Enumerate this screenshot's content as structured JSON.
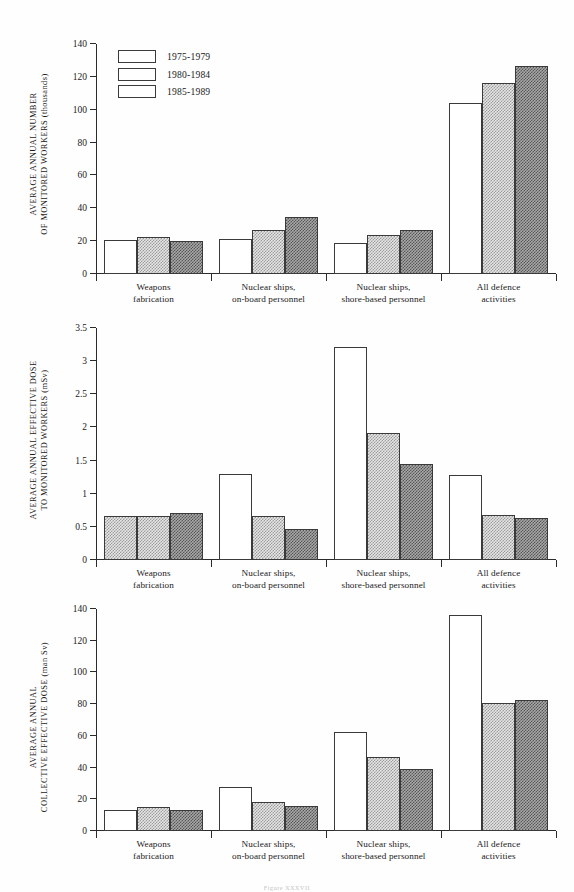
{
  "figure": {
    "caption": "Figure XXXVII",
    "legend": [
      {
        "label": "1975-1979",
        "swatch": "white"
      },
      {
        "label": "1980-1984",
        "swatch": "light-hatch"
      },
      {
        "label": "1985-1989",
        "swatch": "dark-hatch"
      }
    ],
    "categories": [
      "Weapons\nfabrication",
      "Nuclear ships,\non-board personnel",
      "Nuclear ships,\nshore-based personnel",
      "All defence\nactivities"
    ]
  },
  "chart_data": [
    {
      "type": "bar",
      "title": "",
      "ylabel": "AVERAGE ANNUAL NUMBER\nOF MONITORED WORKERS (thousands)",
      "xlabel": "",
      "ylim": [
        0,
        140
      ],
      "yticks": [
        0,
        20,
        40,
        60,
        80,
        100,
        120,
        140
      ],
      "ytick_labels": [
        "0",
        "20",
        "40",
        "60",
        "80",
        "100",
        "120",
        "140"
      ],
      "grid": false,
      "legend_position": "top-left",
      "categories": [
        "Weapons\nfabrication",
        "Nuclear ships,\non-board personnel",
        "Nuclear ships,\nshore-based personnel",
        "All defence\nactivities"
      ],
      "series": [
        {
          "name": "1975-1979",
          "values": [
            21,
            21.5,
            19,
            104
          ]
        },
        {
          "name": "1980-1984",
          "values": [
            22.5,
            26.5,
            24,
            116
          ]
        },
        {
          "name": "1985-1989",
          "values": [
            20,
            34.5,
            27,
            126.5
          ]
        }
      ]
    },
    {
      "type": "bar",
      "title": "",
      "ylabel": "AVERAGE ANNUAL EFFECTIVE DOSE\nTO MONITORED WORKERS (mSv)",
      "xlabel": "",
      "ylim": [
        0,
        3.5
      ],
      "yticks": [
        0,
        0.5,
        1,
        1.5,
        2,
        2.5,
        3,
        3.5
      ],
      "ytick_labels": [
        "0",
        "0.5",
        "1",
        "1.5",
        "2",
        "2.5",
        "3",
        "3.5"
      ],
      "grid": false,
      "legend_position": "none",
      "categories": [
        "Weapons\nfabrication",
        "Nuclear ships,\non-board personnel",
        "Nuclear ships,\nshore-based personnel",
        "All defence\nactivities"
      ],
      "series": [
        {
          "name": "1975-1979",
          "values": [
            0.67,
            1.3,
            3.22,
            1.28
          ]
        },
        {
          "name": "1980-1984",
          "values": [
            0.67,
            0.67,
            1.91,
            0.68
          ]
        },
        {
          "name": "1985-1989",
          "values": [
            0.71,
            0.47,
            1.45,
            0.63
          ]
        }
      ]
    },
    {
      "type": "bar",
      "title": "",
      "ylabel": "AVERAGE ANNUAL\nCOLLECTIVE EFFECTIVE DOSE (man Sv)",
      "xlabel": "",
      "ylim": [
        0,
        140
      ],
      "yticks": [
        0,
        20,
        40,
        60,
        80,
        100,
        120,
        140
      ],
      "ytick_labels": [
        "0",
        "20",
        "40",
        "60",
        "80",
        "100",
        "120",
        "140"
      ],
      "grid": false,
      "legend_position": "none",
      "categories": [
        "Weapons\nfabrication",
        "Nuclear ships,\non-board personnel",
        "Nuclear ships,\nshore-based personnel",
        "All defence\nactivities"
      ],
      "series": [
        {
          "name": "1975-1979",
          "values": [
            13.5,
            28,
            62.5,
            136.5
          ]
        },
        {
          "name": "1980-1984",
          "values": [
            15,
            18,
            46.5,
            81
          ]
        },
        {
          "name": "1985-1989",
          "values": [
            13.5,
            15.5,
            39,
            82.5
          ]
        }
      ]
    }
  ]
}
